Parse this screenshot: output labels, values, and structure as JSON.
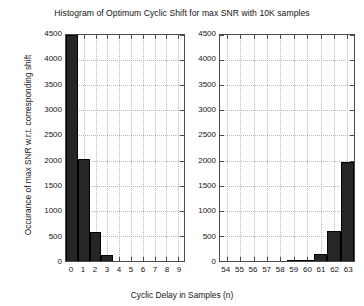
{
  "chart_data": {
    "type": "bar",
    "title": "Histogram of Optimum Cyclic Shift for max SNR with 10K samples",
    "xlabel": "Cyclic Delay in Samples (n)",
    "ylabel": "Occurance of max SNR w.r.t. corresponding shift",
    "ylim": [
      0,
      4500
    ],
    "yticks": [
      0,
      500,
      1000,
      1500,
      2000,
      2500,
      3000,
      3500,
      4000,
      4500
    ],
    "ytick_labels": [
      "0",
      "500",
      "1000",
      "1500",
      "2000",
      "2500",
      "3000",
      "3500",
      "4000",
      "4500"
    ],
    "grid": true,
    "legend": "none",
    "bar_color": "#262626",
    "axis_color": "#4a4a4a",
    "grid_color": "#b9b9b9",
    "note": "Broken x-axis: two panels sharing one y-axis. Left panel bar at n=0 is clipped by the 4500 y-limit.",
    "panels": [
      {
        "name": "left",
        "xlim": [
          -0.5,
          9.5
        ],
        "categories": [
          0,
          1,
          2,
          3,
          4,
          5,
          6,
          7,
          8,
          9
        ],
        "xtick_labels": [
          "0",
          "1",
          "2",
          "3",
          "4",
          "5",
          "6",
          "7",
          "8",
          "9"
        ],
        "values": [
          4650,
          2030,
          570,
          120,
          0,
          0,
          0,
          0,
          0,
          0
        ]
      },
      {
        "name": "right",
        "xlim": [
          53.5,
          63.5
        ],
        "categories": [
          54,
          55,
          56,
          57,
          58,
          59,
          60,
          61,
          62,
          63
        ],
        "xtick_labels": [
          "54",
          "55",
          "56",
          "57",
          "58",
          "59",
          "60",
          "61",
          "62",
          "63"
        ],
        "values": [
          0,
          0,
          0,
          0,
          0,
          10,
          25,
          130,
          600,
          1970
        ]
      }
    ]
  }
}
